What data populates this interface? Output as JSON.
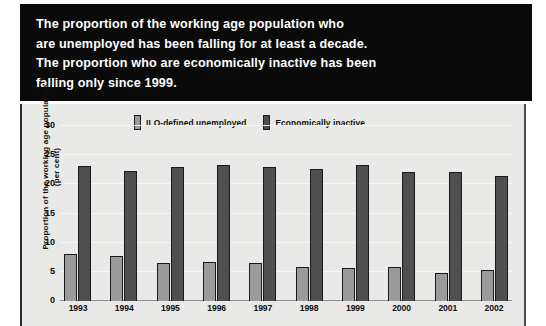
{
  "headline": {
    "lines": [
      "The proportion of the working age population who",
      "are unemployed has been falling for at least a decade.",
      "The proportion who are economically inactive has been",
      "falling only since 1999."
    ]
  },
  "chart_data": {
    "type": "bar",
    "title": "",
    "xlabel": "",
    "ylabel": "Proportion of the working age population (per cent)",
    "ylabel_line1": "Proportion of the working age population",
    "ylabel_line2": "(per cent)",
    "categories": [
      "1993",
      "1994",
      "1995",
      "1996",
      "1997",
      "1998",
      "1999",
      "2000",
      "2001",
      "2002"
    ],
    "series": [
      {
        "name": "ILO-defined unemployed",
        "color": "#9b9b9b",
        "values": [
          8.0,
          7.7,
          6.6,
          6.7,
          6.5,
          5.9,
          5.7,
          5.8,
          4.8,
          5.3
        ]
      },
      {
        "name": "Economically inactive",
        "color": "#4f4f4f",
        "values": [
          23.2,
          22.3,
          23.0,
          23.4,
          22.9,
          22.7,
          23.4,
          22.2,
          22.1,
          21.4
        ]
      }
    ],
    "ylim": [
      0,
      30
    ],
    "yticks": [
      0,
      5,
      10,
      15,
      20,
      25,
      30
    ],
    "ytick_labels": [
      "0",
      "5",
      "10",
      "15",
      "20",
      "25",
      "30"
    ],
    "grid": true,
    "legend_position": "top"
  },
  "colors": {
    "banner_background": "#0a0a0a",
    "banner_text": "#ffffff",
    "panel_background": "#e9e9e7",
    "gridline": "#f7f7f5",
    "axis": "#8f8f8d"
  }
}
